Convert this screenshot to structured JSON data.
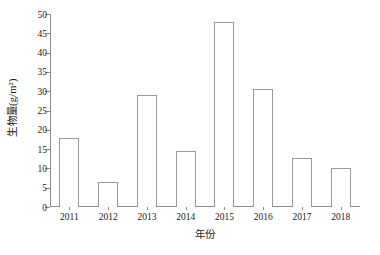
{
  "chart_data": {
    "type": "bar",
    "title": "",
    "subtitle": "",
    "xlabel": "年份",
    "ylabel": "生物量(g/m²)",
    "categories": [
      "2011",
      "2012",
      "2013",
      "2014",
      "2015",
      "2016",
      "2017",
      "2018"
    ],
    "values": [
      18,
      6.5,
      29,
      14.5,
      48,
      30.5,
      12.7,
      10
    ],
    "series": [
      {
        "name": "生物量",
        "values": [
          18,
          6.5,
          29,
          14.5,
          48,
          30.5,
          12.7,
          10
        ]
      }
    ],
    "ylim": [
      0,
      50
    ],
    "ytick_step": 5,
    "yticks": [
      0,
      5,
      10,
      15,
      20,
      25,
      30,
      35,
      40,
      45,
      50
    ],
    "ytick_labels": [
      "0",
      "5",
      "10",
      "15",
      "20",
      "25",
      "30",
      "35",
      "40",
      "45",
      "50"
    ],
    "grid": false,
    "legend": false,
    "legend_position": "none",
    "bar_fill_color": "#ffffff",
    "bar_edge_color": "#9a9a9a",
    "axis_color": "#8c8c8c",
    "text_color": "#1a1a1a",
    "background_color": "#ffffff",
    "axes_style": "open-left-bottom"
  }
}
